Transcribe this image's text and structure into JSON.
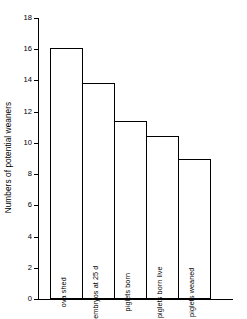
{
  "chart_data": {
    "type": "bar",
    "title": "",
    "subtitle": "",
    "xlabel": "",
    "ylabel": "Numbers of potential weaners",
    "ylim": [
      0,
      18
    ],
    "yticks": [
      0,
      2,
      4,
      6,
      8,
      10,
      12,
      14,
      16,
      18
    ],
    "ytick_labels": [
      "0",
      "2",
      "4",
      "6",
      "8",
      "10",
      "12",
      "14",
      "16",
      "18"
    ],
    "grid": false,
    "legend": null,
    "categories": [
      "ova shed",
      "embryos at 25 d",
      "piglets born",
      "piglets born live",
      "piglets weaned"
    ],
    "values": [
      16.0,
      13.8,
      11.35,
      10.4,
      8.9
    ],
    "bar_style": {
      "fill": "#ffffff",
      "edge": "#000000"
    },
    "annotations": []
  }
}
